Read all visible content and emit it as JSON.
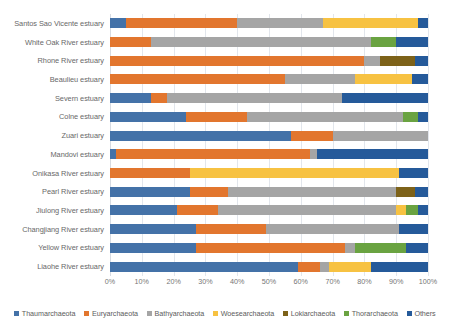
{
  "chart_data": {
    "type": "bar",
    "orientation": "horizontal",
    "stacked": true,
    "stack_mode": "percent",
    "title": "",
    "xlabel": "",
    "ylabel": "",
    "xlim": [
      0,
      100
    ],
    "xticks": [
      "0%",
      "10%",
      "20%",
      "30%",
      "40%",
      "50%",
      "60%",
      "70%",
      "80%",
      "90%",
      "100%"
    ],
    "xtick_values": [
      0,
      10,
      20,
      30,
      40,
      50,
      60,
      70,
      80,
      90,
      100
    ],
    "grid": true,
    "grid_axis": "x",
    "legend_position": "bottom",
    "categories": [
      "Santos Sao Vicente estuary",
      "White Oak River estuary",
      "Rhone River estuary",
      "Beaulieu estuary",
      "Severn estuary",
      "Colne estuary",
      "Zuari estuary",
      "Mandovi estuary",
      "Onikasa River estuary",
      "Pearl River estuary",
      "Jiulong River estuary",
      "Changjiang River estuary",
      "Yellow River estuary",
      "Liaohe River estuary"
    ],
    "series": [
      {
        "name": "Thaumarchaeota",
        "color": "#4472a8",
        "values": [
          5,
          0,
          0,
          0,
          13,
          24,
          57,
          2,
          0,
          25,
          21,
          27,
          27,
          59
        ]
      },
      {
        "name": "Euryarchaeota",
        "color": "#e2762e",
        "values": [
          35,
          13,
          80,
          55,
          5,
          19,
          13,
          61,
          25,
          12,
          13,
          22,
          47,
          7
        ]
      },
      {
        "name": "Bathyarchaeota",
        "color": "#a5a5a5",
        "values": [
          27,
          69,
          5,
          22,
          55,
          49,
          30,
          2,
          0,
          53,
          56,
          42,
          3,
          3
        ]
      },
      {
        "name": "Woesearchaeota",
        "color": "#f7c242",
        "values": [
          30,
          0,
          0,
          18,
          0,
          0,
          0,
          0,
          66,
          0,
          3,
          0,
          0,
          13
        ]
      },
      {
        "name": "Lokiarchaeota",
        "color": "#7d6219",
        "values": [
          0,
          0,
          11,
          0,
          0,
          0,
          0,
          0,
          0,
          6,
          0,
          0,
          0,
          0
        ]
      },
      {
        "name": "Thorarchaeota",
        "color": "#6aa341",
        "values": [
          0,
          8,
          0,
          0,
          0,
          5,
          0,
          0,
          0,
          0,
          4,
          0,
          16,
          0
        ]
      },
      {
        "name": "Others",
        "color": "#255a9a",
        "values": [
          3,
          10,
          4,
          5,
          27,
          3,
          0,
          35,
          9,
          4,
          3,
          9,
          7,
          18
        ]
      }
    ]
  },
  "legend": {
    "items": [
      "Thaumarchaeota",
      "Euryarchaeota",
      "Bathyarchaeota",
      "Woesearchaeota",
      "Lokiarchaeota",
      "Thorarchaeota",
      "Others"
    ]
  },
  "colors": {
    "thaumarchaeota": "#4472a8",
    "euryarchaeota": "#e2762e",
    "bathyarchaeota": "#a5a5a5",
    "woesearchaeota": "#f7c242",
    "lokiarchaeota": "#7d6219",
    "thorarchaeota": "#6aa341",
    "others": "#255a9a",
    "gridline": "#e2e6ec",
    "axis_text": "#767676",
    "label_text": "#686868",
    "background": "#ffffff"
  }
}
